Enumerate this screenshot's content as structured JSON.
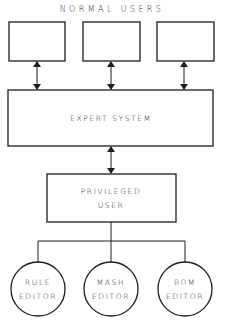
{
  "diagram": {
    "title": "NORMAL USERS",
    "normal_user_boxes": [
      {
        "label": ""
      },
      {
        "label": ""
      },
      {
        "label": ""
      }
    ],
    "expert_system": {
      "label": "EXPERT SYSTEM"
    },
    "privileged_user": {
      "line1": "PRIVILEGED",
      "line2": "USER"
    },
    "editors": [
      {
        "line1": "RULE",
        "line2": "EDITOR"
      },
      {
        "line1": "MASH",
        "line2": "EDITOR"
      },
      {
        "line1": "BOM",
        "line2": "EDITOR"
      }
    ],
    "connections": [
      {
        "from": "normal-user-1",
        "to": "expert-system",
        "type": "bidirectional-arrow"
      },
      {
        "from": "normal-user-2",
        "to": "expert-system",
        "type": "bidirectional-arrow"
      },
      {
        "from": "normal-user-3",
        "to": "expert-system",
        "type": "bidirectional-arrow"
      },
      {
        "from": "expert-system",
        "to": "privileged-user",
        "type": "bidirectional-arrow"
      },
      {
        "from": "privileged-user",
        "to": "rule-editor",
        "type": "line"
      },
      {
        "from": "privileged-user",
        "to": "mash-editor",
        "type": "line"
      },
      {
        "from": "privileged-user",
        "to": "bom-editor",
        "type": "line"
      }
    ],
    "colors": {
      "stroke": "#1e1e1e",
      "text": "#2a2a2a",
      "background": "#ffffff"
    }
  }
}
